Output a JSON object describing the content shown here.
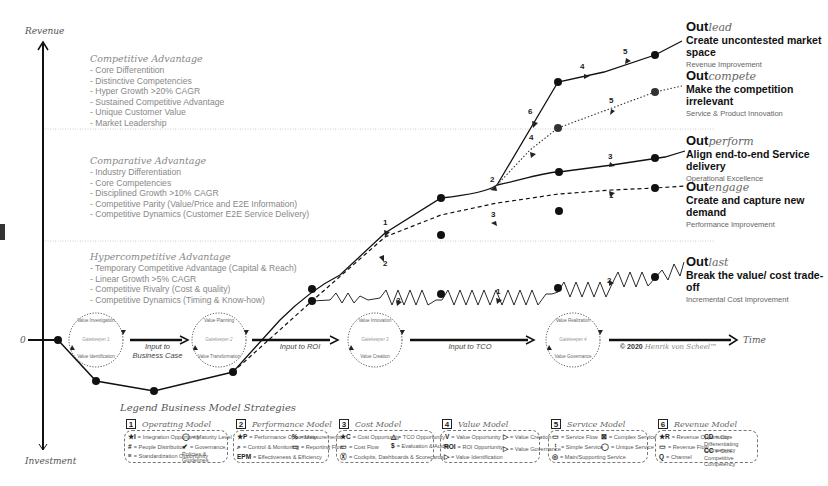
{
  "axes": {
    "y_top": "Revenue",
    "y_bottom": "Investment",
    "x_right": "Time",
    "origin": "0"
  },
  "zones": [
    {
      "title": "Competitive Advantage",
      "items": [
        "Core Differentition",
        "Distinctive Competencies",
        "Hyper Growth >20% CAGR",
        "Sustained Competitive Advantage",
        "Unique Customer Value",
        "Market Leadership"
      ]
    },
    {
      "title": "Comparative Advantage",
      "items": [
        "Industry Differentiation",
        "Core Competencies",
        "Disciplined Growth >10% CAGR",
        "Competitive Parity (Value/Price and E2E Information)",
        "Competitive Dynamics (Customer E2E Service Delivery)"
      ]
    },
    {
      "title": "Hypercompetitive Advantage",
      "items": [
        "Temporary Competitive Advantage (Capital & Reach)",
        "Linear Growth >5% CAGR",
        "Competitive Rivalry (Cost & quality)",
        "Competitive Dynamics (Timing & Know-how)"
      ]
    }
  ],
  "strategies": [
    {
      "prefix": "Out",
      "suffix": "lead",
      "headline": "Create uncontested market space",
      "note": "Revenue Improvement",
      "line_style": "solid"
    },
    {
      "prefix": "Out",
      "suffix": "compete",
      "headline": "Make the competition irrelevant",
      "note": "Service & Product Innovation",
      "line_style": "dotted"
    },
    {
      "prefix": "Out",
      "suffix": "perform",
      "headline": "Align end-to-end Service delivery",
      "note": "Operational Excellence",
      "line_style": "solid"
    },
    {
      "prefix": "Out",
      "suffix": "engage",
      "headline": "Create and capture new demand",
      "note": "Performance Improvement",
      "line_style": "dashed"
    },
    {
      "prefix": "Out",
      "suffix": "last",
      "headline": "Break the value/ cost trade-off",
      "note": "Incremental Cost Improvement",
      "line_style": "zigzag"
    }
  ],
  "gatekeepers": [
    {
      "top": "Value Investigation",
      "center": "Gatekeeper 1",
      "bottom": "Value Identification"
    },
    {
      "top": "Value Planning",
      "center": "Gatekeeper 2",
      "bottom": "Value Transformation"
    },
    {
      "top": "Value Innovation",
      "center": "Gatekeeper 3",
      "bottom": "Value Creation"
    },
    {
      "top": "Value Realization",
      "center": "Gatekeeper 4",
      "bottom": "Value Governance"
    }
  ],
  "flow_labels": [
    "Input to Business Case",
    "Input to ROI",
    "Input to TCO"
  ],
  "copyright": {
    "mark": "© 2020",
    "author": "Henrik von Scheel™"
  },
  "markers": {
    "outlead": [
      "1",
      "2",
      "6",
      "4",
      "5"
    ],
    "outcompete": [
      "4",
      "5"
    ],
    "outperform": [
      "3"
    ],
    "outengage": [
      "2",
      "3",
      "1"
    ],
    "outlast": [
      "3",
      "1",
      "2"
    ]
  },
  "legend": {
    "title": "Legend Business Model Strategies",
    "models": [
      {
        "num": "1",
        "name": "Operating Model",
        "items": [
          {
            "sym": "★I",
            "text": "= Integration Opportunity"
          },
          {
            "sym": "#",
            "text": "= People Distribution"
          },
          {
            "sym": "≡",
            "text": "= Standardization Opportunity"
          },
          {
            "sym": "◯",
            "text": "= Maturity Level"
          },
          {
            "sym": "✔",
            "text": "= Governance, Policies & Guidelines"
          }
        ]
      },
      {
        "num": "2",
        "name": "Performance Model",
        "items": [
          {
            "sym": "★P",
            "text": "= Performance Opportunity"
          },
          {
            "sym": "⌕",
            "text": "= Control & Monitoring"
          },
          {
            "sym": "EPM",
            "text": "= Effectiveness & Efficiency"
          },
          {
            "sym": "%",
            "text": "= Measurements"
          },
          {
            "sym": "▭",
            "text": "= Reporting Flow"
          }
        ]
      },
      {
        "num": "3",
        "name": "Cost Model",
        "items": [
          {
            "sym": "★C",
            "text": "= Cost Opportunity"
          },
          {
            "sym": "▭",
            "text": "= Cost Flow"
          },
          {
            "sym": "Ⓧ",
            "text": "= Cockpits, Dashboards & Scorecards"
          },
          {
            "sym": "△",
            "text": "= TCO Opportunity"
          },
          {
            "sym": "$",
            "text": "= Evaluation & Audits"
          }
        ]
      },
      {
        "num": "4",
        "name": "Value Model",
        "items": [
          {
            "sym": "V",
            "text": "= Value Opportunity"
          },
          {
            "sym": "ROI",
            "text": "= ROI Opportunity"
          },
          {
            "sym": "▷",
            "text": "= Value Identification"
          },
          {
            "sym": "▷",
            "text": "= Value Creation"
          },
          {
            "sym": "▷",
            "text": "= Value Governance"
          }
        ]
      },
      {
        "num": "5",
        "name": "Service Model",
        "items": [
          {
            "sym": "▭",
            "text": "= Service Flow"
          },
          {
            "sym": "⋮",
            "text": "= Simple Service"
          },
          {
            "sym": "◎",
            "text": "= Main/Supporting Service"
          },
          {
            "sym": "⊠",
            "text": "= Complex Service"
          },
          {
            "sym": "◯",
            "text": "= Unique Service"
          }
        ]
      },
      {
        "num": "6",
        "name": "Revenue Model",
        "items": [
          {
            "sym": "★R",
            "text": "= Revenue Opportunity"
          },
          {
            "sym": "▭",
            "text": "= Revenue Flow"
          },
          {
            "sym": "Q",
            "text": "= Channel"
          },
          {
            "sym": "CD",
            "text": "= Core Differentiating Competency"
          },
          {
            "sym": "CC",
            "text": "= Core Competitive Competency"
          }
        ]
      }
    ]
  }
}
